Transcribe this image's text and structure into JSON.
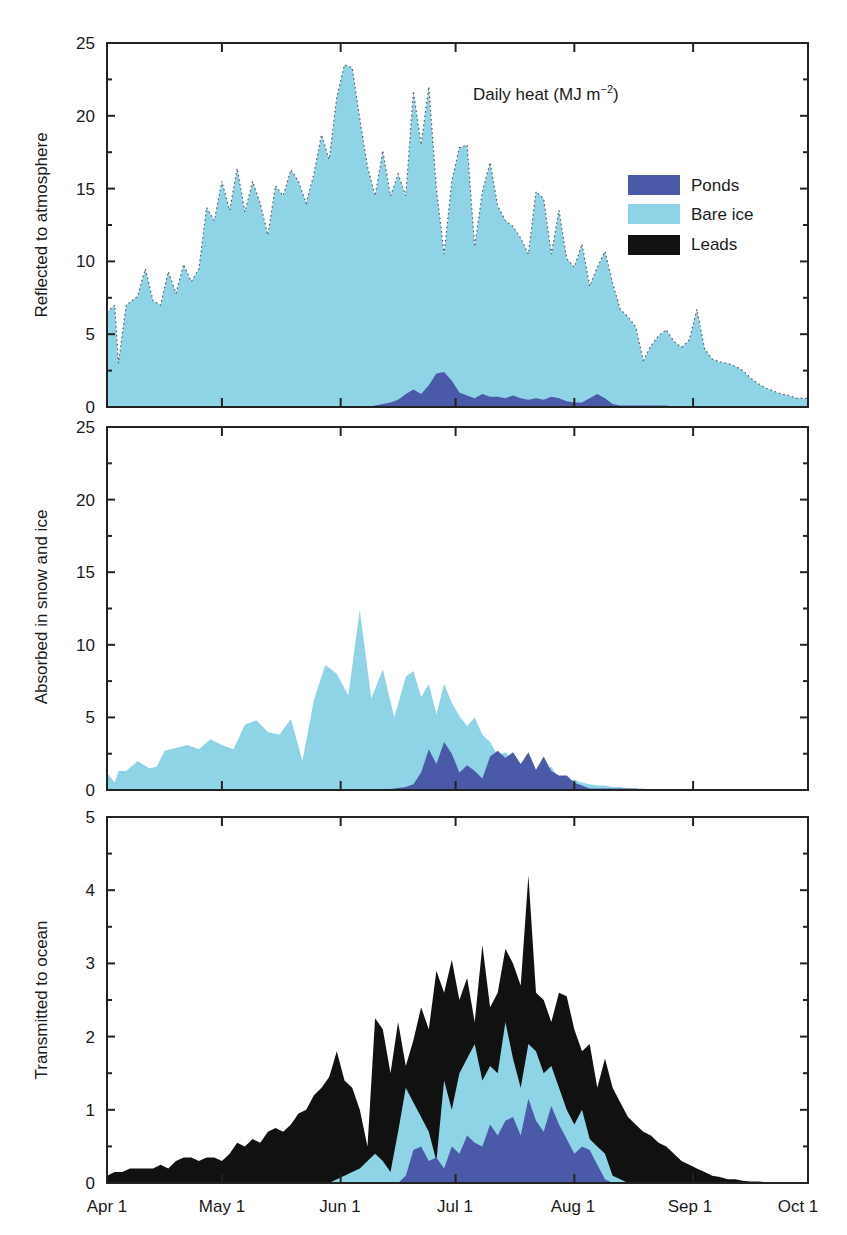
{
  "chart_data": [
    {
      "type": "area",
      "panel": "top",
      "title": "Daily heat (MJ m⁻²)",
      "title_main": "Daily heat (MJ m",
      "title_sup": "−2",
      "title_close": ")",
      "ylabel": "Reflected to atmosphere",
      "ylim": [
        0,
        25
      ],
      "yticks": [
        0,
        5,
        10,
        15,
        20,
        25
      ],
      "stacked": true,
      "x_days": [
        0,
        2,
        3,
        4,
        5,
        8,
        10,
        12,
        14,
        16,
        18,
        20,
        22,
        24,
        26,
        28,
        30,
        32,
        34,
        36,
        38,
        40,
        42,
        44,
        46,
        48,
        50,
        52,
        54,
        56,
        58,
        60,
        62,
        64,
        66,
        68,
        70,
        72,
        74,
        76,
        78,
        80,
        82,
        84,
        86,
        88,
        90,
        92,
        94,
        96,
        98,
        100,
        102,
        104,
        106,
        108,
        110,
        112,
        114,
        116,
        118,
        120,
        122,
        124,
        126,
        128,
        130,
        132,
        134,
        136,
        138,
        140,
        142,
        144,
        146,
        148,
        150,
        152,
        154,
        156,
        158,
        160,
        162,
        164,
        166,
        168,
        170,
        172,
        174,
        176,
        178,
        180,
        183
      ],
      "series": [
        {
          "name": "Ponds",
          "values": [
            0,
            0,
            0,
            0,
            0,
            0,
            0,
            0,
            0,
            0,
            0,
            0,
            0,
            0,
            0,
            0,
            0,
            0,
            0,
            0,
            0,
            0,
            0,
            0,
            0,
            0,
            0,
            0,
            0,
            0,
            0,
            0,
            0,
            0,
            0,
            0,
            0.1,
            0.2,
            0.3,
            0.5,
            0.9,
            1.2,
            0.9,
            1.5,
            2.3,
            2.4,
            1.8,
            1.0,
            0.8,
            0.6,
            0.9,
            0.7,
            0.7,
            0.6,
            0.8,
            0.6,
            0.5,
            0.6,
            0.5,
            0.7,
            0.6,
            0.4,
            0.3,
            0.3,
            0.6,
            0.9,
            0.6,
            0.2,
            0.1,
            0.1,
            0.1,
            0.1,
            0.1,
            0.1,
            0.1,
            0,
            0,
            0,
            0,
            0,
            0,
            0,
            0,
            0,
            0,
            0,
            0,
            0,
            0,
            0,
            0,
            0,
            0
          ]
        },
        {
          "name": "Bare ice",
          "values": [
            6.5,
            7,
            3,
            5,
            7,
            7.6,
            9.5,
            7.3,
            7,
            9.3,
            7.8,
            9.8,
            8.6,
            9.5,
            13.7,
            12.8,
            15.5,
            13.5,
            16.4,
            13.4,
            15.5,
            14,
            11.8,
            15.2,
            14.5,
            16.3,
            15.5,
            14,
            16,
            18.7,
            17,
            21.3,
            23.5,
            23.3,
            19.8,
            16.5,
            14.5,
            17.6,
            14.5,
            16,
            14.5,
            21.7,
            18,
            22,
            15,
            10.5,
            15.5,
            17.8,
            18,
            11,
            14.8,
            16.8,
            13.8,
            12.8,
            12.4,
            11.6,
            10.5,
            14.8,
            14.3,
            10.5,
            13.5,
            10.2,
            9.6,
            11.2,
            8.3,
            9.6,
            10.7,
            8.5,
            6.7,
            6.2,
            5.5,
            3.2,
            4.2,
            4.9,
            5.3,
            4.5,
            4.1,
            4.6,
            6.7,
            4.0,
            3.3,
            3.1,
            3.0,
            2.8,
            2.5,
            2.0,
            1.6,
            1.3,
            1.1,
            0.9,
            0.8,
            0.6,
            0.6
          ]
        },
        {
          "name": "Leads",
          "values": []
        }
      ]
    },
    {
      "type": "area",
      "panel": "middle",
      "ylabel": "Absorbed in snow and ice",
      "ylim": [
        0,
        25
      ],
      "yticks": [
        0,
        5,
        10,
        15,
        20,
        25
      ],
      "stacked": true,
      "x_days": [
        0,
        2,
        3,
        5,
        8,
        11,
        13,
        15,
        18,
        21,
        24,
        27,
        30,
        33,
        36,
        39,
        42,
        45,
        48,
        51,
        54,
        57,
        60,
        63,
        66,
        69,
        72,
        75,
        78,
        80,
        82,
        84,
        86,
        88,
        90,
        92,
        94,
        96,
        98,
        100,
        102,
        104,
        106,
        108,
        110,
        112,
        114,
        116,
        118,
        120,
        122,
        124,
        126,
        128,
        130,
        132,
        134,
        136,
        138,
        140,
        142,
        145,
        148,
        151,
        154,
        157,
        160,
        163,
        166,
        169,
        172,
        175,
        178,
        183
      ],
      "series": [
        {
          "name": "Ponds",
          "values": [
            0,
            0,
            0,
            0,
            0,
            0,
            0,
            0,
            0,
            0,
            0,
            0,
            0,
            0,
            0,
            0,
            0,
            0,
            0,
            0,
            0,
            0,
            0,
            0,
            0,
            0,
            0,
            0.1,
            0.2,
            0.4,
            1.2,
            2.8,
            1.8,
            3.3,
            2.5,
            1.2,
            1.7,
            1.3,
            0.8,
            2.3,
            2.7,
            2.2,
            2.6,
            1.8,
            2.6,
            1.4,
            2.3,
            1.3,
            1.0,
            1.0,
            0.5,
            0.3,
            0.1,
            0.1,
            0.1,
            0.1,
            0.1,
            0.1,
            0.1,
            0,
            0,
            0,
            0,
            0,
            0,
            0,
            0,
            0,
            0,
            0,
            0,
            0,
            0,
            0
          ]
        },
        {
          "name": "Bare ice",
          "values": [
            1.2,
            0.5,
            1.3,
            1.3,
            2.0,
            1.5,
            1.6,
            2.7,
            2.9,
            3.1,
            2.8,
            3.5,
            3.1,
            2.8,
            4.5,
            4.8,
            4.0,
            3.8,
            4.9,
            2.0,
            6.2,
            8.6,
            8.0,
            6.5,
            12.4,
            6.3,
            8.3,
            5.0,
            7.8,
            8.2,
            6.4,
            7.3,
            5.2,
            7.3,
            6.0,
            5.1,
            4.4,
            5.0,
            3.8,
            3.3,
            2.4,
            2.6,
            2.0,
            1.5,
            2.5,
            0.6,
            1.3,
            1.6,
            0.8,
            0.6,
            0.7,
            0.5,
            0.4,
            0.3,
            0.3,
            0.2,
            0.2,
            0.1,
            0.1,
            0.1,
            0,
            0,
            0,
            0,
            0,
            0,
            0,
            0,
            0,
            0,
            0,
            0,
            0,
            0
          ]
        },
        {
          "name": "Leads",
          "values": []
        }
      ]
    },
    {
      "type": "area",
      "panel": "bottom",
      "ylabel": "Transmitted to ocean",
      "ylim": [
        0,
        5
      ],
      "yticks": [
        0,
        1,
        2,
        3,
        4,
        5
      ],
      "xlabel": "",
      "categories": [
        "Apr 1",
        "May 1",
        "Jun 1",
        "Jul 1",
        "Aug 1",
        "Sep 1",
        "Oct 1"
      ],
      "category_days": [
        0,
        30,
        61,
        91,
        122,
        153,
        183
      ],
      "stacked": true,
      "x_days": [
        0,
        2,
        4,
        6,
        8,
        10,
        12,
        14,
        16,
        18,
        20,
        22,
        24,
        26,
        28,
        30,
        32,
        34,
        36,
        38,
        40,
        42,
        44,
        46,
        48,
        50,
        52,
        54,
        56,
        58,
        60,
        62,
        64,
        66,
        68,
        70,
        72,
        74,
        76,
        78,
        80,
        82,
        84,
        86,
        88,
        90,
        92,
        94,
        96,
        98,
        100,
        102,
        104,
        106,
        108,
        110,
        112,
        114,
        116,
        118,
        120,
        122,
        124,
        126,
        128,
        130,
        132,
        134,
        136,
        138,
        140,
        142,
        144,
        146,
        148,
        150,
        152,
        154,
        156,
        158,
        160,
        162,
        164,
        166,
        168,
        170,
        172,
        174,
        176,
        178,
        180,
        183
      ],
      "series": [
        {
          "name": "Ponds",
          "values": [
            0,
            0,
            0,
            0,
            0,
            0,
            0,
            0,
            0,
            0,
            0,
            0,
            0,
            0,
            0,
            0,
            0,
            0,
            0,
            0,
            0,
            0,
            0,
            0,
            0,
            0,
            0,
            0,
            0,
            0,
            0,
            0,
            0,
            0,
            0,
            0,
            0,
            0,
            0,
            0.1,
            0.45,
            0.5,
            0.3,
            0.35,
            0.2,
            0.5,
            0.4,
            0.65,
            0.55,
            0.5,
            0.8,
            0.65,
            0.85,
            0.9,
            0.65,
            1.15,
            0.85,
            0.7,
            1.05,
            0.8,
            0.6,
            0.4,
            0.5,
            0.45,
            0.25,
            0.05,
            0,
            0,
            0,
            0,
            0,
            0,
            0,
            0,
            0,
            0,
            0,
            0,
            0,
            0,
            0,
            0,
            0,
            0,
            0,
            0,
            0,
            0,
            0,
            0,
            0,
            0
          ]
        },
        {
          "name": "Bare ice",
          "values": [
            0,
            0,
            0,
            0,
            0,
            0,
            0,
            0,
            0,
            0,
            0,
            0,
            0,
            0,
            0,
            0,
            0,
            0,
            0,
            0,
            0,
            0,
            0,
            0,
            0,
            0,
            0,
            0,
            0,
            0,
            0.05,
            0.1,
            0.15,
            0.2,
            0.3,
            0.4,
            0.3,
            0.15,
            0.7,
            1.3,
            1.1,
            0.9,
            0.7,
            0.3,
            1.4,
            1.0,
            1.5,
            1.7,
            1.9,
            1.4,
            1.6,
            1.5,
            2.2,
            1.7,
            1.3,
            1.9,
            1.8,
            1.5,
            1.6,
            1.3,
            1.0,
            0.8,
            1.0,
            0.6,
            0.5,
            0.4,
            0.1,
            0.05,
            0,
            0,
            0,
            0,
            0,
            0,
            0,
            0,
            0,
            0,
            0,
            0,
            0,
            0,
            0,
            0,
            0,
            0,
            0,
            0,
            0,
            0,
            0,
            0
          ]
        },
        {
          "name": "Leads",
          "values": [
            0.1,
            0.15,
            0.15,
            0.2,
            0.2,
            0.2,
            0.2,
            0.25,
            0.2,
            0.3,
            0.35,
            0.35,
            0.3,
            0.35,
            0.35,
            0.3,
            0.4,
            0.55,
            0.5,
            0.6,
            0.55,
            0.7,
            0.75,
            0.7,
            0.8,
            0.95,
            1.0,
            1.2,
            1.3,
            1.45,
            1.8,
            1.4,
            1.3,
            1.0,
            0.5,
            2.25,
            2.1,
            1.5,
            2.2,
            1.6,
            1.95,
            2.4,
            2.1,
            2.9,
            2.6,
            3.05,
            2.5,
            2.8,
            2.2,
            3.25,
            2.4,
            2.6,
            3.2,
            3.0,
            2.7,
            4.2,
            2.6,
            2.5,
            2.2,
            2.6,
            2.55,
            2.1,
            1.8,
            1.9,
            1.3,
            1.7,
            1.3,
            1.1,
            0.9,
            0.8,
            0.7,
            0.65,
            0.55,
            0.5,
            0.4,
            0.3,
            0.25,
            0.2,
            0.15,
            0.1,
            0.08,
            0.05,
            0.05,
            0.03,
            0.02,
            0.02,
            0.01,
            0.01,
            0.01,
            0.01,
            0.01,
            0.01
          ]
        }
      ]
    }
  ],
  "legend": {
    "items": [
      {
        "label": "Ponds",
        "color": "#4a5aa8"
      },
      {
        "label": "Bare ice",
        "color": "#8fd3e6"
      },
      {
        "label": "Leads",
        "color": "#111111"
      }
    ]
  },
  "colors": {
    "ponds": "#4a5aa8",
    "bare_ice": "#8fd3e6",
    "leads": "#111111",
    "axis": "#222222"
  },
  "x_axis": {
    "labels": [
      "Apr 1",
      "May 1",
      "Jun 1",
      "Jul 1",
      "Aug 1",
      "Sep 1",
      "Oct 1"
    ],
    "days": [
      0,
      30,
      61,
      91,
      122,
      153,
      183
    ],
    "total_days": 183
  },
  "panels": [
    {
      "id": "top",
      "ylabel": "Reflected to atmosphere",
      "ymax": 25,
      "ytick_labels": [
        "0",
        "5",
        "10",
        "15",
        "20",
        "25"
      ]
    },
    {
      "id": "middle",
      "ylabel": "Absorbed in snow and ice",
      "ymax": 25,
      "ytick_labels": [
        "0",
        "5",
        "10",
        "15",
        "20",
        "25"
      ]
    },
    {
      "id": "bottom",
      "ylabel": "Transmitted to ocean",
      "ymax": 5,
      "ytick_labels": [
        "0",
        "1",
        "2",
        "3",
        "4",
        "5"
      ]
    }
  ]
}
